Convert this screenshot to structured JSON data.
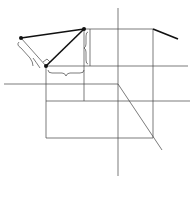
{
  "diagram": {
    "caption": "(b)",
    "axes": {
      "x_label": "X",
      "z_label": "Z",
      "y_label_right": "Y",
      "y_label_bottom": "Y",
      "origin_label": "O"
    },
    "front_view": {
      "point_b_label": "b'",
      "point_a_label": "a'",
      "point_A0_label": "A0",
      "angle_label": "β",
      "delta_y_label": "ΔY",
      "delta_x_label": "ΔX",
      "delta_z_label": "ΔZ"
    },
    "side_view": {
      "point_b_label": "b''",
      "point_a_label": "a''",
      "point_A0_label": "A0",
      "angle_label": "γ",
      "delta_x_label": "ΔX"
    },
    "top_view": {
      "point_b_label": "b",
      "point_a_label": "a",
      "point_A0_label": "A0",
      "angle_label": "α",
      "delta_y_label": "ΔY",
      "delta_z_label": "ΔZ"
    }
  }
}
